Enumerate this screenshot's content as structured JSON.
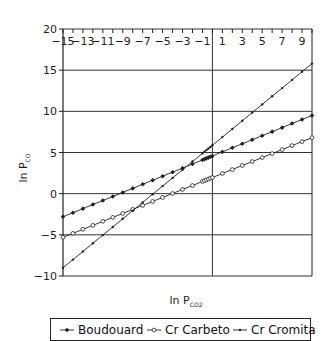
{
  "chart_data": {
    "type": "line",
    "title": "",
    "xlabel": "ln P",
    "xlabel_sub": "CO2",
    "ylabel": "ln P",
    "ylabel_sub": "CO",
    "xlim": [
      -15,
      10
    ],
    "ylim": [
      -10,
      20
    ],
    "x_ticks": [
      -15,
      -13,
      -11,
      -9,
      -7,
      -5,
      -3,
      -1,
      1,
      3,
      5,
      7,
      9
    ],
    "x_tick_labels": [
      "−15",
      "−13",
      "−11",
      "−9",
      "−7",
      "−5",
      "−3",
      "−1",
      "1",
      "3",
      "5",
      "7",
      "9"
    ],
    "y_ticks": [
      -10,
      -5,
      0,
      5,
      10,
      15,
      20
    ],
    "y_tick_labels": [
      "−10",
      "−5",
      "0",
      "5",
      "10",
      "15",
      "20"
    ],
    "x_axis_position": "top",
    "grid": {
      "horizontal": true,
      "vertical_at_zero": true
    },
    "legend_position": "bottom",
    "x": [
      -15,
      -14,
      -13,
      -12,
      -11,
      -10,
      -9,
      -8,
      -7,
      -6,
      -5,
      -4,
      -3,
      -2,
      -1,
      -0.8,
      -0.6,
      -0.4,
      -0.2,
      0,
      1,
      2,
      3,
      4,
      5,
      6,
      7,
      8,
      9,
      10
    ],
    "series": [
      {
        "name": "Boudouard",
        "marker": "filled-diamond",
        "values": [
          -2.8,
          -2.31,
          -1.82,
          -1.32,
          -0.83,
          -0.34,
          0.15,
          0.64,
          1.14,
          1.63,
          2.12,
          2.61,
          3.1,
          3.6,
          4.09,
          4.19,
          4.29,
          4.38,
          4.48,
          4.58,
          5.07,
          5.57,
          6.06,
          6.55,
          7.04,
          7.53,
          8.02,
          8.52,
          9.01,
          9.5
        ]
      },
      {
        "name": "Cr Carbeto",
        "marker": "open-circle",
        "values": [
          -5.3,
          -4.82,
          -4.33,
          -3.85,
          -3.36,
          -2.88,
          -2.4,
          -1.91,
          -1.43,
          -0.94,
          -0.46,
          0.02,
          0.51,
          0.99,
          1.48,
          1.58,
          1.67,
          1.77,
          1.87,
          1.96,
          2.45,
          2.93,
          3.42,
          3.9,
          4.38,
          4.87,
          5.35,
          5.84,
          6.32,
          6.8
        ]
      },
      {
        "name": "Cr Cromita",
        "marker": "small-dot",
        "values": [
          -9.0,
          -8.01,
          -7.02,
          -6.02,
          -5.03,
          -4.04,
          -3.05,
          -2.06,
          -1.06,
          -0.07,
          0.92,
          1.91,
          2.9,
          3.9,
          4.89,
          5.09,
          5.29,
          5.48,
          5.68,
          5.88,
          6.87,
          7.86,
          8.86,
          9.85,
          10.84,
          11.83,
          12.82,
          13.82,
          14.81,
          15.8
        ]
      }
    ]
  },
  "legend": {
    "items": [
      {
        "label": "Boudouard",
        "marker": "filled-diamond"
      },
      {
        "label": "Cr Carbeto",
        "marker": "open-circle"
      },
      {
        "label": "Cr Cromita",
        "marker": "small-dot"
      }
    ]
  },
  "colors": {
    "line": "#222222",
    "grid": "#333333",
    "background": "#ffffff"
  }
}
